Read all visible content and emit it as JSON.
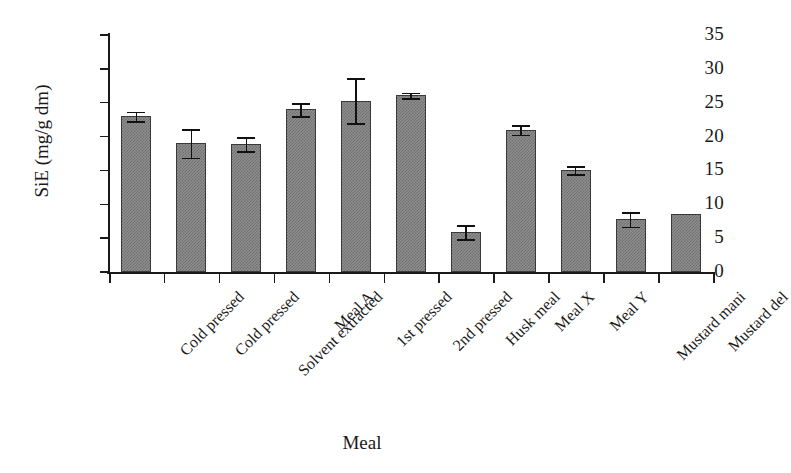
{
  "chart_data": {
    "type": "bar",
    "title": "",
    "subtitle": "",
    "xlabel": "Meal",
    "ylabel": "SiE (mg/g dm)",
    "ylim": [
      0,
      35
    ],
    "yticks": [
      0,
      5,
      10,
      15,
      20,
      25,
      30,
      35
    ],
    "grid": false,
    "legend": null,
    "bar_color": "#8e8e8e",
    "bar_edge_color": "#3a3a3a",
    "error_bar_color": "#111111",
    "categories": [
      "Cold pressed",
      "Cold pressed",
      "Solvent extracted",
      "Meal A",
      "1st pressed",
      "2nd pressed",
      "Husk meal",
      "Meal X",
      "Meal Y",
      "Mustard mani",
      "Mustard del"
    ],
    "values": [
      23.0,
      19.0,
      18.9,
      24.0,
      25.3,
      26.1,
      5.9,
      21.0,
      15.0,
      7.8,
      8.5
    ],
    "errors": [
      0.7,
      2.1,
      1.0,
      1.0,
      3.3,
      0.4,
      1.0,
      0.7,
      0.6,
      1.1,
      0.0
    ]
  }
}
